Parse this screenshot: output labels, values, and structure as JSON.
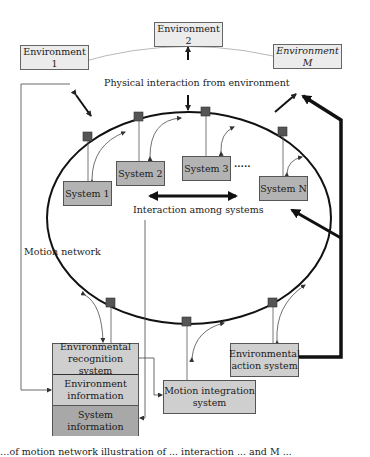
{
  "environments": [
    {
      "label": "Environment 1"
    },
    {
      "label": "Environment 2"
    },
    {
      "label": "Environment M"
    }
  ],
  "systems": [
    {
      "label": "System 1"
    },
    {
      "label": "System 2"
    },
    {
      "label": "System 3"
    },
    {
      "label": "System N"
    }
  ],
  "labels": {
    "physical_interaction": "Physical interaction from environment",
    "interaction_among_systems": "Interaction among systems",
    "motion_network": "Motion network",
    "ellipsis": "·····"
  },
  "modules": {
    "recognition": "Environmental recognition system",
    "environment_info": "Environment information",
    "system_info": "System information",
    "motion_integration": "Motion integration system",
    "action": "Environmental action system"
  },
  "caption": "…of motion network illustration of ... interaction ... and M ..."
}
